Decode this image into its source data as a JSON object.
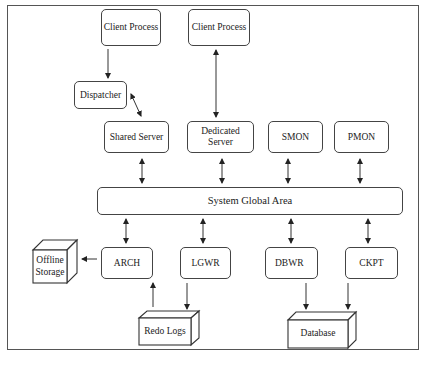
{
  "diagram": {
    "nodes": {
      "client_process_1": "Client Process",
      "client_process_2": "Client Process",
      "dispatcher": "Dispatcher",
      "shared_server": "Shared Server",
      "dedicated_server": "Dedicated Server",
      "smon": "SMON",
      "pmon": "PMON",
      "sga": "System Global Area",
      "arch": "ARCH",
      "lgwr": "LGWR",
      "dbwr": "DBWR",
      "ckpt": "CKPT",
      "offline_storage_line1": "Offline",
      "offline_storage_line2": "Storage",
      "redo_logs": "Redo Logs",
      "database": "Database"
    },
    "edges": [
      {
        "from": "Client Process",
        "to": "Dispatcher",
        "type": "one-way"
      },
      {
        "from": "Dispatcher",
        "to": "Shared Server",
        "type": "two-way"
      },
      {
        "from": "Client Process",
        "to": "Dedicated Server",
        "type": "two-way"
      },
      {
        "from": "Shared Server",
        "to": "System Global Area",
        "type": "two-way"
      },
      {
        "from": "Dedicated Server",
        "to": "System Global Area",
        "type": "two-way"
      },
      {
        "from": "SMON",
        "to": "System Global Area",
        "type": "two-way"
      },
      {
        "from": "PMON",
        "to": "System Global Area",
        "type": "two-way"
      },
      {
        "from": "System Global Area",
        "to": "ARCH",
        "type": "two-way"
      },
      {
        "from": "System Global Area",
        "to": "LGWR",
        "type": "two-way"
      },
      {
        "from": "System Global Area",
        "to": "DBWR",
        "type": "two-way"
      },
      {
        "from": "System Global Area",
        "to": "CKPT",
        "type": "two-way"
      },
      {
        "from": "ARCH",
        "to": "Offline Storage",
        "type": "one-way"
      },
      {
        "from": "Redo Logs",
        "to": "ARCH",
        "type": "one-way"
      },
      {
        "from": "LGWR",
        "to": "Redo Logs",
        "type": "one-way"
      },
      {
        "from": "DBWR",
        "to": "Database",
        "type": "one-way"
      },
      {
        "from": "CKPT",
        "to": "Database",
        "type": "one-way"
      }
    ],
    "colors": {
      "stroke": "#444444",
      "background": "#ffffff",
      "text": "#222222"
    }
  }
}
